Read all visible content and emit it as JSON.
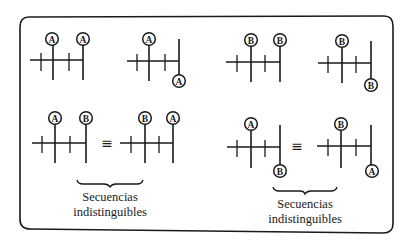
{
  "figure": {
    "frame": {
      "x": 19,
      "y": 16,
      "width": 374,
      "height": 215,
      "radius": 10,
      "stroke": "#1a1a1a"
    },
    "equivalence_symbol": "≡",
    "row1": {
      "diagrams": [
        {
          "id": "d1",
          "label_top_1": "A",
          "label_top_2": "A"
        },
        {
          "id": "d2",
          "label_top": "A",
          "label_bottom": "A"
        },
        {
          "id": "d3",
          "label_top_1": "B",
          "label_top_2": "B"
        },
        {
          "id": "d4",
          "label_top": "B",
          "label_bottom": "B"
        }
      ]
    },
    "row2": {
      "left_group": {
        "lhs": {
          "label_top_1": "A",
          "label_top_2": "B"
        },
        "rhs": {
          "label_top_1": "B",
          "label_top_2": "A"
        },
        "caption_line1": "Secuencias",
        "caption_line2": "indistinguibles"
      },
      "right_group": {
        "lhs": {
          "label_top": "A",
          "label_bottom": "B"
        },
        "rhs": {
          "label_top": "B",
          "label_bottom": "A"
        },
        "caption_line1": "Secuencias",
        "caption_line2": "indistinguibles"
      }
    }
  }
}
